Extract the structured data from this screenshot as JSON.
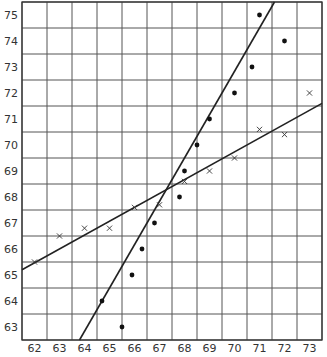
{
  "chart_data": {
    "type": "scatter",
    "title": "",
    "xlabel": "",
    "ylabel": "",
    "xlim": [
      61.5,
      73.5
    ],
    "ylim": [
      62.5,
      75.5
    ],
    "grid": true,
    "legend": null,
    "x_ticks": [
      "62",
      "63",
      "64",
      "65",
      "66",
      "67",
      "68",
      "69",
      "70",
      "71",
      "72",
      "73"
    ],
    "y_ticks": [
      "75",
      "74",
      "73",
      "72",
      "71",
      "70",
      "69",
      "68",
      "67",
      "66",
      "65",
      "64",
      "63"
    ],
    "series": [
      {
        "name": "dots",
        "marker": "filled-circle",
        "points": [
          [
            71.0,
            75.0
          ],
          [
            72.0,
            74.0
          ],
          [
            70.7,
            73.0
          ],
          [
            70.0,
            72.0
          ],
          [
            69.0,
            71.0
          ],
          [
            68.5,
            70.0
          ],
          [
            68.0,
            69.0
          ],
          [
            67.8,
            68.0
          ],
          [
            66.8,
            67.0
          ],
          [
            66.3,
            66.0
          ],
          [
            65.9,
            65.0
          ],
          [
            64.7,
            64.0
          ],
          [
            65.5,
            63.0
          ]
        ]
      },
      {
        "name": "crosses",
        "marker": "x",
        "points": [
          [
            62.0,
            65.5
          ],
          [
            63.0,
            66.5
          ],
          [
            64.0,
            66.8
          ],
          [
            65.0,
            66.8
          ],
          [
            66.0,
            67.6
          ],
          [
            67.0,
            67.7
          ],
          [
            68.0,
            68.6
          ],
          [
            69.0,
            69.0
          ],
          [
            70.0,
            69.5
          ],
          [
            71.0,
            70.6
          ],
          [
            72.0,
            70.4
          ],
          [
            73.0,
            72.0
          ]
        ]
      }
    ],
    "lines": [
      {
        "name": "steep-regression-line",
        "from": [
          63.8,
          62.5
        ],
        "to": [
          71.6,
          75.5
        ]
      },
      {
        "name": "gentle-regression-line",
        "from": [
          61.5,
          65.2
        ],
        "to": [
          73.5,
          71.6
        ]
      }
    ]
  }
}
